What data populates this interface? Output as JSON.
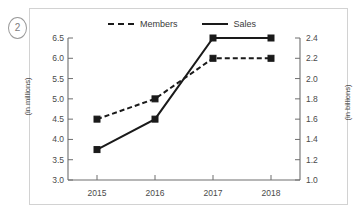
{
  "figure": {
    "item_number": "2"
  },
  "legend": {
    "position": "top-center",
    "entries": [
      {
        "label": "Members",
        "style": "dashed",
        "color": "#1a1a1a"
      },
      {
        "label": "Sales",
        "style": "solid",
        "color": "#1a1a1a"
      }
    ]
  },
  "chart_data": {
    "type": "line",
    "title": "",
    "subtitle": "",
    "xlabel": "",
    "ylabel": "(in millions)",
    "y2label": "(in billions)",
    "categories": [
      "2015",
      "2016",
      "2017",
      "2018"
    ],
    "x": [
      "2015",
      "2016",
      "2017",
      "2018"
    ],
    "grid": false,
    "legend_position": "top-center",
    "ylim": [
      3.0,
      6.5
    ],
    "y2lim": [
      1.0,
      2.4
    ],
    "yticks": [
      "3.0",
      "3.5",
      "4.0",
      "4.5",
      "5.0",
      "5.5",
      "6.0",
      "6.5"
    ],
    "ytick_values": [
      3.0,
      3.5,
      4.0,
      4.5,
      5.0,
      5.5,
      6.0,
      6.5
    ],
    "y2ticks": [
      "1.0",
      "1.2",
      "1.4",
      "1.6",
      "1.8",
      "2.0",
      "2.2",
      "2.4"
    ],
    "y2tick_values": [
      1.0,
      1.2,
      1.4,
      1.6,
      1.8,
      2.0,
      2.2,
      2.4
    ],
    "series": [
      {
        "name": "Members",
        "axis": "left",
        "style": "dashed",
        "marker": "square",
        "color": "#1a1a1a",
        "values": [
          4.5,
          5.0,
          6.0,
          6.0
        ],
        "unit": "millions"
      },
      {
        "name": "Sales",
        "axis": "right",
        "style": "solid",
        "marker": "square",
        "color": "#1a1a1a",
        "values": [
          1.3,
          1.6,
          2.4,
          2.4
        ],
        "unit": "billions"
      }
    ]
  }
}
